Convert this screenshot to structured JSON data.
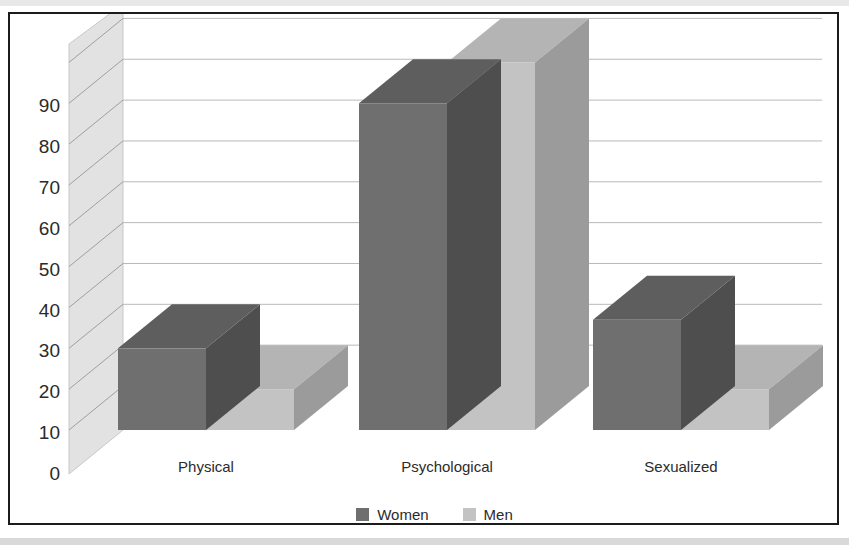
{
  "chart_data": {
    "type": "bar",
    "title": "",
    "subtitle": "",
    "xlabel": "",
    "ylabel": "",
    "categories": [
      "Physical",
      "Psychological",
      "Sexualized"
    ],
    "series": [
      {
        "name": "Women",
        "values": [
          20,
          80,
          27
        ],
        "color": "#6f6f6f"
      },
      {
        "name": "Men",
        "values": [
          10,
          90,
          10
        ],
        "color": "#c3c3c3"
      }
    ],
    "ylim": [
      0,
      95
    ],
    "yticks": [
      0,
      10,
      20,
      30,
      40,
      50,
      60,
      70,
      80,
      90
    ],
    "ytick_labels": [
      "0",
      "10",
      "20",
      "30",
      "40",
      "50",
      "60",
      "70",
      "80",
      "90"
    ],
    "grid": true,
    "grid_axis": "y",
    "legend_position": "bottom",
    "three_d": true,
    "annotations": []
  },
  "axis": {
    "ticks": [
      {
        "value": 90,
        "label": "90"
      },
      {
        "value": 80,
        "label": "80"
      },
      {
        "value": 70,
        "label": "70"
      },
      {
        "value": 60,
        "label": "60"
      },
      {
        "value": 50,
        "label": "50"
      },
      {
        "value": 40,
        "label": "40"
      },
      {
        "value": 30,
        "label": "30"
      },
      {
        "value": 20,
        "label": "20"
      },
      {
        "value": 10,
        "label": "10"
      },
      {
        "value": 0,
        "label": "0"
      }
    ]
  },
  "categories": [
    {
      "label": "Physical"
    },
    {
      "label": "Psychological"
    },
    {
      "label": "Sexualized"
    }
  ],
  "legend": {
    "entries": [
      {
        "label": "Women",
        "color": "#6f6f6f"
      },
      {
        "label": "Men",
        "color": "#c3c3c3"
      }
    ]
  },
  "colors": {
    "women_front": "#6f6f6f",
    "women_top": "#5e5e5e",
    "women_side": "#4e4e4e",
    "men_front": "#c3c3c3",
    "men_top": "#b4b4b4",
    "men_side": "#9b9b9b",
    "wall": "#e2e2e2",
    "gridline": "#b9b9b9",
    "frame": "#1b1b1b",
    "text": "#2b2b2b"
  }
}
